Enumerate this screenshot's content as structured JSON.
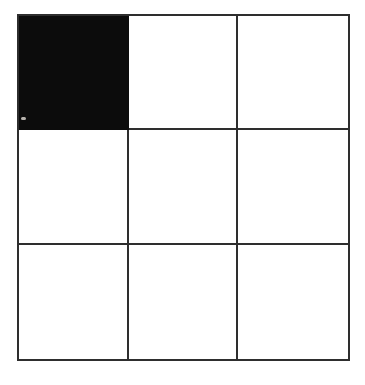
{
  "figure": {
    "name": "3x3-grid",
    "rows": 3,
    "cols": 3,
    "cells": [
      [
        "filled",
        "empty",
        "empty"
      ],
      [
        "empty",
        "empty",
        "empty"
      ],
      [
        "empty",
        "empty",
        "empty"
      ]
    ],
    "colors": {
      "line": "#2e2e2e",
      "fill": "#0c0c0c",
      "background": "#ffffff"
    }
  }
}
